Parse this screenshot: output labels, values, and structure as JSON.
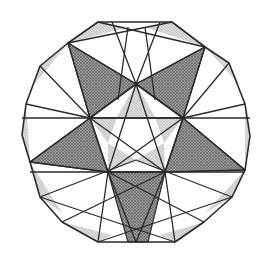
{
  "diagram": {
    "title": "",
    "colors": {
      "background": "#ffffff",
      "line": "#2a2a2a",
      "dark_fill": "#8c8c8c",
      "light_fill": "#cfcfcf"
    },
    "outer_polygon": [
      [
        98,
        22
      ],
      [
        172,
        22
      ],
      [
        205,
        47
      ],
      [
        229,
        63
      ],
      [
        245,
        104
      ],
      [
        250,
        136
      ],
      [
        245,
        170
      ],
      [
        232,
        197
      ],
      [
        204,
        222
      ],
      [
        175,
        242
      ],
      [
        98,
        242
      ],
      [
        62,
        222
      ],
      [
        40,
        197
      ],
      [
        30,
        162
      ],
      [
        22,
        135
      ],
      [
        26,
        104
      ],
      [
        40,
        66
      ],
      [
        68,
        43
      ]
    ],
    "pentagon": [
      [
        136,
        84
      ],
      [
        183,
        118
      ],
      [
        165,
        172
      ],
      [
        108,
        172
      ],
      [
        90,
        118
      ]
    ],
    "star_tips": [
      [
        68,
        43
      ],
      [
        205,
        47
      ],
      [
        245,
        170
      ],
      [
        136,
        242
      ],
      [
        30,
        162
      ]
    ],
    "dark_regions": [
      [
        [
          68,
          43
        ],
        [
          136,
          84
        ],
        [
          90,
          118
        ]
      ],
      [
        [
          205,
          47
        ],
        [
          183,
          118
        ],
        [
          136,
          84
        ]
      ],
      [
        [
          30,
          162
        ],
        [
          90,
          118
        ],
        [
          108,
          172
        ]
      ],
      [
        [
          245,
          170
        ],
        [
          165,
          172
        ],
        [
          183,
          118
        ]
      ],
      [
        [
          108,
          172
        ],
        [
          165,
          172
        ],
        [
          148,
          242
        ],
        [
          128,
          242
        ]
      ]
    ],
    "light_regions": [
      [
        [
          98,
          22
        ],
        [
          128,
          27
        ],
        [
          68,
          43
        ]
      ],
      [
        [
          172,
          22
        ],
        [
          205,
          47
        ],
        [
          145,
          27
        ]
      ],
      [
        [
          205,
          47
        ],
        [
          229,
          63
        ],
        [
          240,
          85
        ]
      ],
      [
        [
          245,
          104
        ],
        [
          250,
          136
        ],
        [
          245,
          170
        ]
      ],
      [
        [
          245,
          170
        ],
        [
          232,
          197
        ],
        [
          205,
          213
        ]
      ],
      [
        [
          175,
          242
        ],
        [
          204,
          222
        ],
        [
          160,
          235
        ]
      ],
      [
        [
          98,
          242
        ],
        [
          62,
          222
        ],
        [
          112,
          235
        ]
      ],
      [
        [
          40,
          197
        ],
        [
          30,
          162
        ],
        [
          62,
          213
        ]
      ],
      [
        [
          30,
          162
        ],
        [
          22,
          135
        ],
        [
          26,
          104
        ]
      ],
      [
        [
          40,
          66
        ],
        [
          68,
          43
        ],
        [
          34,
          85
        ]
      ],
      [
        [
          136,
          84
        ],
        [
          155,
          117
        ],
        [
          117,
          117
        ]
      ],
      [
        [
          183,
          118
        ],
        [
          155,
          117
        ],
        [
          164,
          143
        ]
      ],
      [
        [
          165,
          172
        ],
        [
          164,
          143
        ],
        [
          136,
          160
        ]
      ],
      [
        [
          108,
          172
        ],
        [
          136,
          160
        ],
        [
          108,
          143
        ]
      ],
      [
        [
          90,
          118
        ],
        [
          108,
          143
        ],
        [
          117,
          117
        ]
      ]
    ],
    "lines": [
      [
        [
          68,
          43
        ],
        [
          136,
          84
        ]
      ],
      [
        [
          205,
          47
        ],
        [
          136,
          84
        ]
      ],
      [
        [
          68,
          43
        ],
        [
          90,
          118
        ]
      ],
      [
        [
          205,
          47
        ],
        [
          183,
          118
        ]
      ],
      [
        [
          30,
          162
        ],
        [
          90,
          118
        ]
      ],
      [
        [
          30,
          162
        ],
        [
          108,
          172
        ]
      ],
      [
        [
          245,
          170
        ],
        [
          183,
          118
        ]
      ],
      [
        [
          245,
          170
        ],
        [
          165,
          172
        ]
      ],
      [
        [
          136,
          242
        ],
        [
          108,
          172
        ]
      ],
      [
        [
          136,
          242
        ],
        [
          165,
          172
        ]
      ],
      [
        [
          22,
          118
        ],
        [
          250,
          118
        ]
      ],
      [
        [
          30,
          172
        ],
        [
          245,
          172
        ]
      ],
      [
        [
          136,
          84
        ],
        [
          108,
          172
        ]
      ],
      [
        [
          136,
          84
        ],
        [
          165,
          172
        ]
      ],
      [
        [
          90,
          118
        ],
        [
          165,
          172
        ]
      ],
      [
        [
          183,
          118
        ],
        [
          108,
          172
        ]
      ],
      [
        [
          90,
          118
        ],
        [
          183,
          118
        ]
      ],
      [
        [
          112,
          22
        ],
        [
          136,
          84
        ]
      ],
      [
        [
          160,
          22
        ],
        [
          136,
          84
        ]
      ],
      [
        [
          128,
          27
        ],
        [
          118,
          100
        ]
      ],
      [
        [
          145,
          27
        ],
        [
          155,
          100
        ]
      ],
      [
        [
          98,
          22
        ],
        [
          205,
          47
        ]
      ],
      [
        [
          172,
          22
        ],
        [
          68,
          43
        ]
      ],
      [
        [
          26,
          104
        ],
        [
          90,
          118
        ]
      ],
      [
        [
          245,
          104
        ],
        [
          183,
          118
        ]
      ],
      [
        [
          40,
          66
        ],
        [
          90,
          118
        ]
      ],
      [
        [
          229,
          63
        ],
        [
          183,
          118
        ]
      ],
      [
        [
          40,
          197
        ],
        [
          136,
          160
        ]
      ],
      [
        [
          232,
          197
        ],
        [
          136,
          160
        ]
      ],
      [
        [
          62,
          222
        ],
        [
          165,
          172
        ]
      ],
      [
        [
          204,
          222
        ],
        [
          108,
          172
        ]
      ],
      [
        [
          98,
          242
        ],
        [
          108,
          172
        ]
      ],
      [
        [
          175,
          242
        ],
        [
          165,
          172
        ]
      ],
      [
        [
          40,
          197
        ],
        [
          175,
          242
        ]
      ],
      [
        [
          232,
          197
        ],
        [
          98,
          242
        ]
      ]
    ]
  }
}
